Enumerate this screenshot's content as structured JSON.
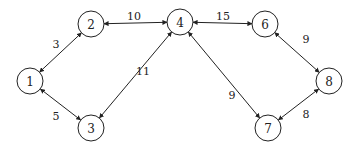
{
  "graph": {
    "nodes": [
      {
        "id": "1",
        "label": "1",
        "x": 30,
        "y": 81
      },
      {
        "id": "2",
        "label": "2",
        "x": 91,
        "y": 24
      },
      {
        "id": "3",
        "label": "3",
        "x": 91,
        "y": 128
      },
      {
        "id": "4",
        "label": "4",
        "x": 180,
        "y": 22
      },
      {
        "id": "6",
        "label": "6",
        "x": 265,
        "y": 24
      },
      {
        "id": "7",
        "label": "7",
        "x": 268,
        "y": 128
      },
      {
        "id": "8",
        "label": "8",
        "x": 329,
        "y": 81
      }
    ],
    "edges": [
      {
        "from": "1",
        "to": "2",
        "weight": "3",
        "lx": 56,
        "ly": 44
      },
      {
        "from": "1",
        "to": "3",
        "weight": "5",
        "lx": 56,
        "ly": 116
      },
      {
        "from": "2",
        "to": "4",
        "weight": "10",
        "lx": 134,
        "ly": 16
      },
      {
        "from": "4",
        "to": "3",
        "weight": "11",
        "lx": 143,
        "ly": 71
      },
      {
        "from": "4",
        "to": "6",
        "weight": "15",
        "lx": 223,
        "ly": 16
      },
      {
        "from": "4",
        "to": "7",
        "weight": "9",
        "lx": 232,
        "ly": 95
      },
      {
        "from": "6",
        "to": "8",
        "weight": "9",
        "lx": 306,
        "ly": 39
      },
      {
        "from": "7",
        "to": "8",
        "weight": "8",
        "lx": 306,
        "ly": 114
      }
    ],
    "node_radius": 13,
    "bidirectional": true
  }
}
